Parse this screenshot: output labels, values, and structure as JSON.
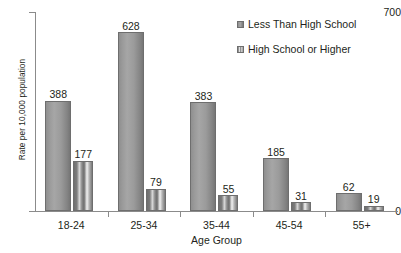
{
  "chart_data": {
    "type": "bar",
    "title": "",
    "xlabel": "Age Group",
    "ylabel": "Rate per 10,000 population",
    "categories": [
      "18-24",
      "25-34",
      "35-44",
      "45-54",
      "55+"
    ],
    "series": [
      {
        "name": "Less Than High School",
        "values": [
          388,
          628,
          383,
          185,
          62
        ]
      },
      {
        "name": "High School or Higher",
        "values": [
          177,
          79,
          55,
          31,
          19
        ]
      }
    ],
    "ylim": [
      0,
      700
    ],
    "ytick_labels": [
      "0",
      "700"
    ],
    "ytick_values": [
      0,
      700
    ],
    "grid": false,
    "legend_position": "top-right",
    "data_labels": true
  },
  "axes": {
    "y_title": "Rate per 10,000 population",
    "y_max_label": "700",
    "y_min_label": "0",
    "x_title": "Age Group"
  },
  "legend": {
    "items": [
      {
        "label": "Less Than High School"
      },
      {
        "label": "High School or Higher"
      }
    ]
  },
  "colors": {
    "series_0": "#9a9a9a",
    "series_1": "#8a8a8a",
    "axis": "#8b8b8b",
    "text": "#231f20",
    "background": "#ffffff"
  }
}
